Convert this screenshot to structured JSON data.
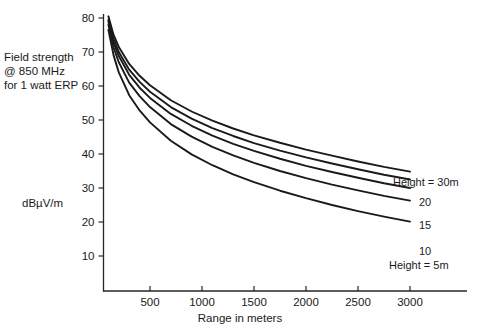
{
  "chart_data": {
    "type": "line",
    "title": "",
    "xlabel": "Range in meters",
    "ylabel": "dBµV/m",
    "annotation": "Field strength\n@ 850 MHz\nfor 1 watt ERP",
    "xlim": [
      0,
      3550
    ],
    "ylim": [
      0,
      85
    ],
    "xticks": [
      500,
      1000,
      1500,
      2000,
      2500,
      3000
    ],
    "xticklabels": [
      "500",
      "1000",
      "1500",
      "2000",
      "2500",
      "3000"
    ],
    "yticks": [
      10,
      20,
      30,
      40,
      50,
      60,
      70,
      80
    ],
    "yticklabels": [
      "10",
      "20",
      "30",
      "40",
      "50",
      "60",
      "70",
      "80"
    ],
    "grid": false,
    "legend_position": "right-inline-curve-labels",
    "x": [
      100,
      150,
      200,
      300,
      400,
      500,
      700,
      900,
      1100,
      1300,
      1500,
      1750,
      2000,
      2250,
      2500,
      2750,
      3000
    ],
    "series": [
      {
        "name": "Height = 30m",
        "label": "Height = 30m",
        "height_m": 30,
        "values": [
          80.5,
          75.0,
          71.5,
          66.5,
          63.0,
          60.2,
          55.8,
          52.5,
          49.8,
          47.5,
          45.5,
          43.3,
          41.3,
          39.5,
          37.8,
          36.2,
          34.8
        ]
      },
      {
        "name": "20",
        "label": "20",
        "height_m": 20,
        "values": [
          79.5,
          73.8,
          70.0,
          64.8,
          61.2,
          58.3,
          53.8,
          50.4,
          47.6,
          45.3,
          43.2,
          41.0,
          39.0,
          37.2,
          35.5,
          33.9,
          32.5
        ]
      },
      {
        "name": "15",
        "label": "15",
        "height_m": 15,
        "values": [
          79.0,
          72.8,
          68.8,
          63.3,
          59.5,
          56.5,
          51.8,
          48.3,
          45.4,
          43.0,
          40.9,
          38.6,
          36.5,
          34.7,
          33.0,
          31.4,
          30.0
        ]
      },
      {
        "name": "10",
        "label": "10",
        "height_m": 10,
        "values": [
          78.0,
          71.3,
          67.0,
          61.0,
          57.0,
          53.8,
          48.8,
          45.1,
          42.1,
          39.6,
          37.4,
          35.0,
          32.9,
          31.0,
          29.3,
          27.7,
          26.3
        ]
      },
      {
        "name": "Height = 5m",
        "label": "Height = 5m",
        "height_m": 5,
        "values": [
          76.5,
          69.0,
          64.0,
          57.3,
          52.8,
          49.3,
          43.9,
          39.9,
          36.7,
          34.0,
          31.7,
          29.2,
          27.0,
          25.0,
          23.2,
          21.6,
          20.1
        ]
      }
    ]
  },
  "axes": {
    "x_title": "Range in meters",
    "y_title": "dBµV/m",
    "left_annotation_line1": "Field strength",
    "left_annotation_line2": "@ 850 MHz",
    "left_annotation_line3": "for 1 watt ERP"
  },
  "curve_labels": {
    "top": "Height = 30m",
    "second": "20",
    "third": "15",
    "fourth": "10",
    "bottom": "Height = 5m"
  },
  "colors": {
    "ink": "#1a1a1a",
    "axis": "#262626",
    "background": "#ffffff"
  }
}
